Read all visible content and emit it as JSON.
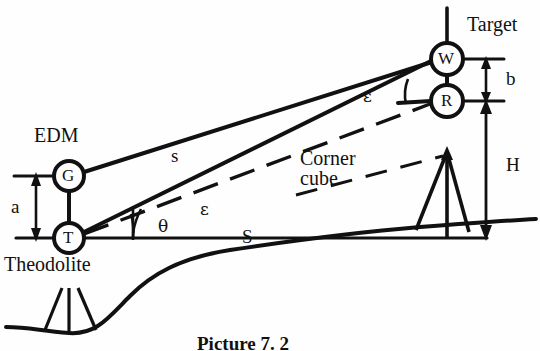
{
  "figure": {
    "caption": "Picture 7. 2",
    "background_color": "#fefefe",
    "ink_color": "#111111"
  },
  "nodes": [
    {
      "id": "G",
      "label": "G",
      "x": 69,
      "y": 176,
      "r": 15,
      "desc": "edm-unit"
    },
    {
      "id": "T",
      "label": "T",
      "x": 69,
      "y": 238,
      "r": 15,
      "desc": "theodolite-unit"
    },
    {
      "id": "W",
      "label": "W",
      "x": 447,
      "y": 59,
      "r": 16,
      "desc": "target-unit"
    },
    {
      "id": "R",
      "label": "R",
      "x": 447,
      "y": 101,
      "r": 16,
      "desc": "reflector-unit"
    }
  ],
  "labels": {
    "edm": "EDM",
    "theodolite": "Theodolite",
    "target": "Target",
    "corner_cube": "Corner\ncube"
  },
  "dimensions": {
    "a": "a",
    "b": "b",
    "H": "H",
    "S": "S",
    "s": "s"
  },
  "angles": {
    "epsilon_lower": "ε",
    "epsilon_upper": "ε",
    "theta": "θ"
  }
}
